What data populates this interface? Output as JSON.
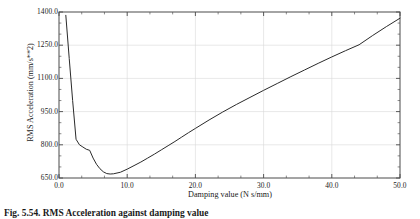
{
  "figure": {
    "caption": "Fig. 5.54. RMS Acceleration against damping value"
  },
  "axes": {
    "x_title": "Damping value (N s/mm)",
    "y_title": "RMS Acceleration (mm/s**2)",
    "x_ticks": [
      "0.0",
      "10.0",
      "20.0",
      "30.0",
      "40.0",
      "50.0"
    ],
    "y_ticks": [
      "1400.0",
      "1250.0",
      "1100.0",
      "950.0",
      "800.0",
      "650.0"
    ]
  },
  "chart_data": {
    "type": "line",
    "title": "",
    "subtitle": "",
    "xlabel": "Damping value (N s/mm)",
    "ylabel": "RMS Acceleration (mm/s**2)",
    "xlim": [
      0.0,
      50.0
    ],
    "ylim": [
      650.0,
      1400.0
    ],
    "xticks": [
      0.0,
      10.0,
      20.0,
      30.0,
      40.0,
      50.0
    ],
    "yticks": [
      650.0,
      800.0,
      950.0,
      1100.0,
      1250.0,
      1400.0
    ],
    "x_minor_ticks_per_interval": 2,
    "y_minor_ticks_per_interval": 2,
    "grid": true,
    "grid_color": "#d8d8d8",
    "legend": false,
    "legend_position": "none",
    "line_color": "#2a2a2a",
    "line_width": 1.0,
    "annotations": [],
    "series": [
      {
        "name": "RMS Acceleration",
        "x": [
          1.0,
          1.5,
          2.0,
          2.5,
          3.0,
          3.5,
          4.0,
          4.5,
          5.0,
          5.5,
          6.0,
          6.5,
          7.0,
          7.5,
          8.0,
          9.0,
          10.0,
          11.0,
          12.0,
          13.0,
          14.0,
          15.0,
          16.0,
          17.0,
          18.0,
          19.0,
          20.0,
          22.0,
          24.0,
          26.0,
          28.0,
          30.0,
          32.0,
          34.0,
          36.0,
          38.0,
          40.0,
          42.0,
          44.0,
          46.0,
          48.0,
          50.0
        ],
        "y": [
          1385,
          1190,
          1000,
          825,
          800,
          790,
          780,
          775,
          740,
          712,
          692,
          678,
          670,
          668,
          669,
          676,
          690,
          706,
          722,
          740,
          758,
          777,
          796,
          815,
          835,
          855,
          874,
          912,
          948,
          982,
          1014,
          1046,
          1077,
          1108,
          1138,
          1168,
          1197,
          1225,
          1252,
          1294,
          1334,
          1372
        ]
      }
    ]
  }
}
